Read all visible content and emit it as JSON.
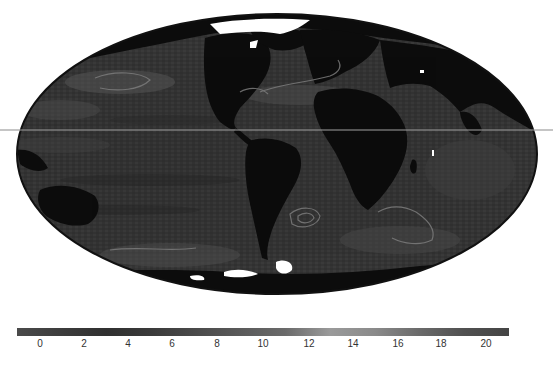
{
  "figure": {
    "type": "global map",
    "projection": "Hammer/Mollweide (equal-area, elliptical)",
    "center_longitude_approx": -60,
    "colors": {
      "background": "#ffffff",
      "ocean_base": "#343434",
      "ocean_light": "#4a4a4a",
      "land": "#0c0c0c",
      "contour": "#7c7c7c",
      "ice": "#ffffff",
      "outline": "#111111"
    }
  },
  "colorbar": {
    "min": 0,
    "max": 20,
    "ticks": [
      "0",
      "2",
      "4",
      "6",
      "8",
      "10",
      "12",
      "14",
      "16",
      "18",
      "20"
    ],
    "tick_positions_px": [
      40,
      84,
      128,
      172,
      217,
      263,
      309,
      353,
      398,
      441,
      486
    ],
    "gradient": [
      "#4a4a4a",
      "#3c3c3c",
      "#303030",
      "#3a3a3a",
      "#4a4a4a",
      "#5a5a5a",
      "#6a6a6a",
      "#9a9a9a",
      "#8a8a8a",
      "#6a6a6a",
      "#505050",
      "#444444"
    ]
  },
  "chart_data": {
    "type": "heatmap",
    "title": "",
    "xlabel": "",
    "ylabel": "",
    "colorbar_range": [
      0,
      20
    ],
    "colorbar_ticks": [
      0,
      2,
      4,
      6,
      8,
      10,
      12,
      14,
      16,
      18,
      20
    ]
  }
}
